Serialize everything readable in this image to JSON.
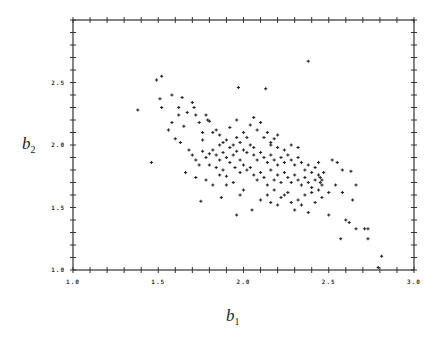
{
  "chart_data": {
    "type": "scatter",
    "title": "",
    "xlabel": "b1",
    "ylabel": "b2",
    "xlabel_display": {
      "base": "b",
      "sub": "1"
    },
    "ylabel_display": {
      "base": "b",
      "sub": "2"
    },
    "xlim": [
      1.0,
      3.0
    ],
    "ylim": [
      1.0,
      3.0
    ],
    "xticks_labeled": [
      "1.0",
      "1.5",
      "2.0",
      "2.5",
      "3.0"
    ],
    "yticks_labeled": [
      "1.0",
      "1.5",
      "2.0",
      "2.5"
    ],
    "minor_tick_step": 0.1,
    "grid": false,
    "legend": null,
    "marker": "plus",
    "points": [
      [
        1.38,
        2.28
      ],
      [
        1.46,
        1.86
      ],
      [
        1.49,
        2.52
      ],
      [
        1.52,
        2.55
      ],
      [
        1.51,
        2.37
      ],
      [
        1.52,
        2.3
      ],
      [
        1.58,
        2.4
      ],
      [
        1.62,
        2.3
      ],
      [
        1.64,
        2.38
      ],
      [
        1.65,
        2.15
      ],
      [
        1.6,
        2.05
      ],
      [
        1.63,
        2.02
      ],
      [
        1.67,
        2.26
      ],
      [
        1.7,
        2.34
      ],
      [
        1.71,
        2.3
      ],
      [
        1.72,
        2.24
      ],
      [
        1.74,
        2.18
      ],
      [
        1.76,
        2.1
      ],
      [
        1.78,
        2.24
      ],
      [
        1.79,
        2.2
      ],
      [
        1.8,
        2.19
      ],
      [
        1.82,
        2.1
      ],
      [
        1.84,
        2.12
      ],
      [
        1.86,
        2.08
      ],
      [
        1.88,
        2.02
      ],
      [
        1.9,
        2.04
      ],
      [
        1.92,
        1.98
      ],
      [
        1.94,
        2.0
      ],
      [
        1.96,
        2.06
      ],
      [
        1.98,
        2.02
      ],
      [
        1.68,
        1.96
      ],
      [
        1.7,
        1.92
      ],
      [
        1.72,
        1.88
      ],
      [
        1.74,
        1.84
      ],
      [
        1.76,
        1.95
      ],
      [
        1.78,
        1.9
      ],
      [
        1.8,
        1.93
      ],
      [
        1.82,
        1.96
      ],
      [
        1.84,
        1.92
      ],
      [
        1.86,
        1.88
      ],
      [
        1.88,
        1.94
      ],
      [
        1.9,
        1.9
      ],
      [
        1.92,
        1.86
      ],
      [
        1.94,
        1.92
      ],
      [
        1.96,
        1.95
      ],
      [
        1.98,
        1.88
      ],
      [
        2.0,
        1.96
      ],
      [
        2.02,
        1.94
      ],
      [
        2.04,
        2.0
      ],
      [
        2.06,
        1.98
      ],
      [
        1.66,
        1.78
      ],
      [
        1.72,
        1.74
      ],
      [
        1.78,
        1.72
      ],
      [
        1.82,
        1.68
      ],
      [
        1.88,
        1.8
      ],
      [
        1.9,
        1.75
      ],
      [
        1.95,
        1.82
      ],
      [
        1.98,
        1.78
      ],
      [
        2.0,
        1.84
      ],
      [
        2.02,
        1.8
      ],
      [
        1.97,
        2.46
      ],
      [
        2.13,
        2.45
      ],
      [
        2.38,
        2.67
      ],
      [
        2.08,
        2.12
      ],
      [
        2.1,
        2.18
      ],
      [
        2.12,
        2.06
      ],
      [
        2.14,
        2.1
      ],
      [
        2.16,
        2.02
      ],
      [
        2.18,
        2.05
      ],
      [
        2.2,
        2.08
      ],
      [
        2.06,
        1.92
      ],
      [
        2.08,
        1.88
      ],
      [
        2.1,
        1.94
      ],
      [
        2.12,
        1.9
      ],
      [
        2.14,
        1.86
      ],
      [
        2.16,
        1.92
      ],
      [
        2.18,
        1.88
      ],
      [
        2.2,
        1.84
      ],
      [
        2.22,
        1.9
      ],
      [
        2.24,
        1.86
      ],
      [
        2.04,
        1.82
      ],
      [
        2.06,
        1.76
      ],
      [
        2.08,
        1.72
      ],
      [
        2.1,
        1.78
      ],
      [
        2.12,
        1.74
      ],
      [
        2.14,
        1.68
      ],
      [
        2.16,
        1.8
      ],
      [
        2.18,
        1.72
      ],
      [
        2.2,
        1.76
      ],
      [
        2.22,
        1.7
      ],
      [
        2.24,
        1.96
      ],
      [
        2.26,
        1.92
      ],
      [
        2.28,
        1.88
      ],
      [
        2.3,
        1.84
      ],
      [
        2.32,
        1.9
      ],
      [
        2.34,
        1.86
      ],
      [
        2.36,
        1.8
      ],
      [
        2.38,
        1.84
      ],
      [
        2.4,
        1.78
      ],
      [
        2.42,
        1.82
      ],
      [
        2.24,
        1.78
      ],
      [
        2.26,
        1.74
      ],
      [
        2.28,
        1.7
      ],
      [
        2.3,
        1.76
      ],
      [
        2.32,
        1.72
      ],
      [
        2.34,
        1.68
      ],
      [
        2.36,
        1.74
      ],
      [
        2.38,
        1.7
      ],
      [
        2.4,
        1.66
      ],
      [
        2.42,
        1.72
      ],
      [
        2.44,
        1.76
      ],
      [
        2.45,
        1.74
      ],
      [
        2.45,
        1.7
      ],
      [
        2.46,
        1.72
      ],
      [
        2.46,
        1.68
      ],
      [
        2.47,
        1.78
      ],
      [
        2.44,
        1.64
      ],
      [
        2.4,
        1.62
      ],
      [
        2.36,
        1.6
      ],
      [
        2.32,
        1.56
      ],
      [
        2.26,
        1.62
      ],
      [
        2.22,
        1.58
      ],
      [
        2.18,
        1.64
      ],
      [
        2.14,
        1.6
      ],
      [
        2.1,
        1.56
      ],
      [
        2.28,
        1.54
      ],
      [
        2.34,
        1.52
      ],
      [
        2.2,
        1.52
      ],
      [
        2.16,
        1.54
      ],
      [
        2.24,
        1.6
      ],
      [
        2.52,
        1.88
      ],
      [
        2.55,
        1.86
      ],
      [
        2.58,
        1.8
      ],
      [
        2.63,
        1.79
      ],
      [
        2.54,
        1.68
      ],
      [
        2.58,
        1.62
      ],
      [
        2.64,
        1.56
      ],
      [
        2.5,
        1.62
      ],
      [
        2.46,
        1.58
      ],
      [
        2.42,
        1.54
      ],
      [
        2.5,
        1.44
      ],
      [
        2.66,
        1.68
      ],
      [
        2.6,
        1.4
      ],
      [
        2.62,
        1.38
      ],
      [
        2.66,
        1.33
      ],
      [
        2.71,
        1.33
      ],
      [
        2.73,
        1.33
      ],
      [
        2.73,
        1.25
      ],
      [
        2.57,
        1.25
      ],
      [
        2.81,
        1.11
      ],
      [
        2.79,
        1.02
      ],
      [
        2.38,
        1.46
      ],
      [
        2.3,
        1.48
      ],
      [
        2.0,
        1.64
      ],
      [
        1.98,
        1.6
      ],
      [
        1.94,
        1.7
      ],
      [
        1.9,
        1.68
      ],
      [
        1.86,
        1.76
      ],
      [
        1.84,
        1.82
      ],
      [
        1.8,
        1.84
      ],
      [
        1.96,
        1.44
      ],
      [
        2.05,
        1.48
      ],
      [
        1.87,
        1.58
      ],
      [
        1.75,
        1.55
      ],
      [
        2.28,
        2.0
      ],
      [
        2.32,
        1.98
      ],
      [
        2.0,
        2.1
      ],
      [
        2.02,
        2.06
      ],
      [
        1.92,
        2.14
      ],
      [
        1.96,
        2.2
      ],
      [
        2.04,
        2.16
      ],
      [
        2.06,
        2.22
      ],
      [
        2.16,
        2.0
      ],
      [
        2.2,
        1.98
      ],
      [
        1.86,
        2.0
      ],
      [
        1.76,
        2.04
      ],
      [
        1.62,
        2.24
      ],
      [
        1.56,
        2.12
      ],
      [
        1.58,
        2.18
      ],
      [
        2.44,
        1.86
      ]
    ]
  }
}
